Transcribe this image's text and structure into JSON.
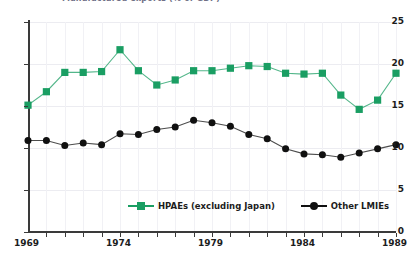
{
  "chart_data": {
    "type": "line",
    "title": "Manufactured exports (% of GDP)",
    "xlabel": "",
    "ylabel": "",
    "xlim": [
      1969,
      1989
    ],
    "ylim": [
      0,
      25
    ],
    "grid": true,
    "legend_position": "bottom-center-inside",
    "x": [
      1969,
      1970,
      1971,
      1972,
      1973,
      1974,
      1975,
      1976,
      1977,
      1978,
      1979,
      1980,
      1981,
      1982,
      1983,
      1984,
      1985,
      1986,
      1987,
      1988,
      1989
    ],
    "xticks": [
      1969,
      1974,
      1979,
      1984,
      1989
    ],
    "xtick_labels": [
      "1969",
      "1974",
      "1979",
      "1984",
      "1989"
    ],
    "yticks": [
      0,
      5,
      10,
      15,
      20,
      25
    ],
    "ytick_labels": [
      "0",
      "5",
      "10",
      "15",
      "20",
      "25"
    ],
    "series": [
      {
        "name": "HPAEs (excluding Japan)",
        "color": "#1a9e63",
        "marker": "square",
        "values": [
          15.1,
          16.7,
          19.0,
          19.0,
          19.1,
          21.7,
          19.2,
          17.5,
          18.1,
          19.2,
          19.2,
          19.5,
          19.8,
          19.7,
          18.9,
          18.8,
          18.9,
          16.3,
          14.6,
          15.7,
          18.9
        ]
      },
      {
        "name": "Other LMIEs",
        "color": "#101010",
        "marker": "circle",
        "values": [
          10.9,
          10.9,
          10.3,
          10.6,
          10.4,
          11.7,
          11.6,
          12.2,
          12.5,
          13.3,
          13.0,
          12.6,
          11.6,
          11.1,
          9.9,
          9.3,
          9.2,
          8.9,
          9.4,
          9.9,
          10.4
        ]
      }
    ]
  },
  "legend": {
    "items": [
      {
        "label": "HPAEs (excluding Japan)",
        "color": "#1a9e63",
        "marker": "square"
      },
      {
        "label": "Other LMIEs",
        "color": "#101010",
        "marker": "circle"
      }
    ]
  }
}
